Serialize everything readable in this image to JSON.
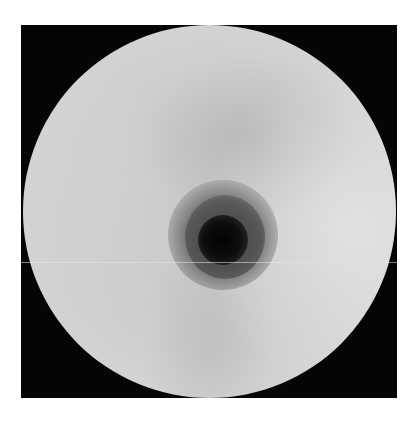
{
  "image": {
    "description": "Grayscale circular field-of-view image on black square background with a dark central spot surrounded by a gray halo",
    "colors": {
      "background": "#ffffff",
      "frame": "#050505",
      "field": "#cfcfcf",
      "halo": "#646464",
      "core": "#050505"
    }
  }
}
